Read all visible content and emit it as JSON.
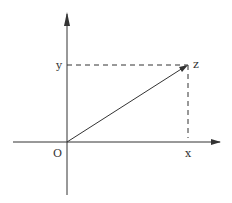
{
  "diagram": {
    "type": "complex-plane-vector",
    "labels": {
      "origin": "O",
      "x_axis_point": "x",
      "y_axis_point": "y",
      "point": "z"
    },
    "colors": {
      "line": "#333333",
      "background": "#ffffff"
    },
    "geometry": {
      "origin": [
        67,
        142
      ],
      "point_z": [
        188,
        65
      ],
      "x_axis": {
        "from": [
          13,
          142
        ],
        "to": [
          222,
          142
        ]
      },
      "y_axis": {
        "from": [
          67,
          195
        ],
        "to": [
          67,
          12
        ]
      }
    }
  }
}
